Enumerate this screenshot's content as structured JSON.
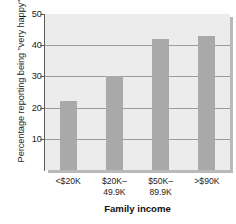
{
  "chart_data": {
    "type": "bar",
    "title": "",
    "subtitle": "",
    "categories": [
      "<$20K",
      "$20K–49.9K",
      "$50K–89.9K",
      ">$90K"
    ],
    "category_lines": [
      [
        "<$20K",
        ""
      ],
      [
        "$20K–",
        "49.9K"
      ],
      [
        "$50K–",
        "89.9K"
      ],
      [
        ">$90K",
        ""
      ]
    ],
    "values": [
      22,
      30,
      42,
      43
    ],
    "xlabel": "Family income",
    "ylabel": "Percentage reporting being \"very happy\"",
    "ylim": [
      0,
      50
    ],
    "yticks": [
      10,
      20,
      30,
      40,
      50
    ],
    "ytick_labels": [
      "10",
      "20",
      "30",
      "40",
      "50"
    ],
    "grid": true,
    "grid_axis": "y",
    "legend": false,
    "legend_position": "none",
    "bar_color": "#a9a9a9",
    "plot_background": "#ececed",
    "gridline_color": "#9c9c9c",
    "axis_color": "#5b5b5b",
    "text_color": "#1d1d1d"
  }
}
